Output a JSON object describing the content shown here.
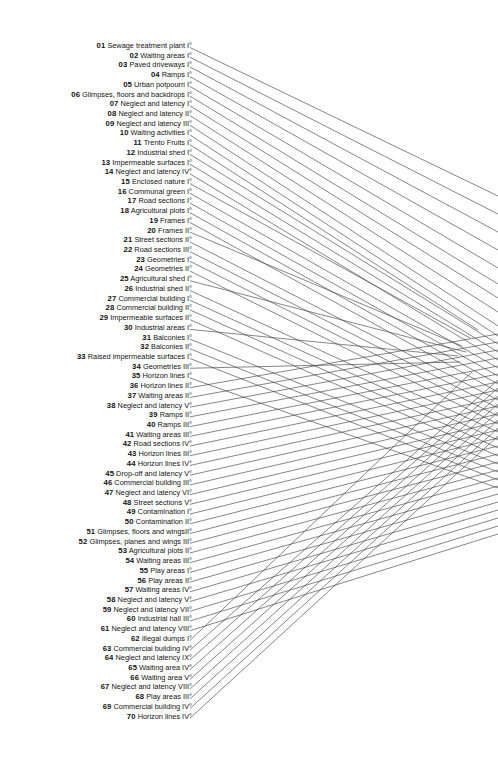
{
  "figure": {
    "type": "legend-with-leader-lines",
    "background_color": "#ffffff",
    "text_color": "#131313",
    "line_color": "#3a3a3a",
    "item_count": 70
  },
  "legend": {
    "items": [
      {
        "num": "01",
        "label": "Sewage treatment plant I°"
      },
      {
        "num": "02",
        "label": "Waiting areas I°"
      },
      {
        "num": "03",
        "label": "Paved driveways I°"
      },
      {
        "num": "04",
        "label": "Ramps I°"
      },
      {
        "num": "05",
        "label": "Urban potpourri I°"
      },
      {
        "num": "06",
        "label": "Glimpses, floors and backdrops I°"
      },
      {
        "num": "07",
        "label": "Neglect and latency I°"
      },
      {
        "num": "08",
        "label": "Neglect and latency II°"
      },
      {
        "num": "09",
        "label": "Neglect and latency III°"
      },
      {
        "num": "10",
        "label": "Waiting activities I°"
      },
      {
        "num": "11",
        "label": "Trento Fruits I°"
      },
      {
        "num": "12",
        "label": "Industrial shed I°"
      },
      {
        "num": "13",
        "label": "Impermeable surfaces I°"
      },
      {
        "num": "14",
        "label": "Neglect and latency IV°"
      },
      {
        "num": "15",
        "label": "Enclosed nature I°"
      },
      {
        "num": "16",
        "label": "Communal green I°"
      },
      {
        "num": "17",
        "label": "Road sections I°"
      },
      {
        "num": "18",
        "label": "Agricultural plots I°"
      },
      {
        "num": "19",
        "label": "Frames I°"
      },
      {
        "num": "20",
        "label": "Frames II°"
      },
      {
        "num": "21",
        "label": "Street sections II°"
      },
      {
        "num": "22",
        "label": "Road sections III°"
      },
      {
        "num": "23",
        "label": "Geometries I°"
      },
      {
        "num": "24",
        "label": "Geometries II°"
      },
      {
        "num": "25",
        "label": "Agricultural shed I°"
      },
      {
        "num": "26",
        "label": "Industrial shed II°"
      },
      {
        "num": "27",
        "label": "Commercial building I°"
      },
      {
        "num": "28",
        "label": "Commercial building II°"
      },
      {
        "num": "29",
        "label": "Impermeable surfaces II°"
      },
      {
        "num": "30",
        "label": "Industrial areas I°"
      },
      {
        "num": "31",
        "label": "Balconies I°"
      },
      {
        "num": "32",
        "label": "Balconies II°"
      },
      {
        "num": "33",
        "label": "Raised impermeable surfaces I°"
      },
      {
        "num": "34",
        "label": "Geometries III°"
      },
      {
        "num": "35",
        "label": "Horizon lines I°"
      },
      {
        "num": "36",
        "label": "Horizon lines II°"
      },
      {
        "num": "37",
        "label": "Waiting areas II°"
      },
      {
        "num": "38",
        "label": "Neglect and latency V°"
      },
      {
        "num": "39",
        "label": "Ramps II°"
      },
      {
        "num": "40",
        "label": "Ramps III°"
      },
      {
        "num": "41",
        "label": "Waiting areas III°"
      },
      {
        "num": "42",
        "label": "Road sections IV°"
      },
      {
        "num": "43",
        "label": "Horizon lines III°"
      },
      {
        "num": "44",
        "label": "Horizon lines IV°"
      },
      {
        "num": "45",
        "label": "Drop-off and latency V°"
      },
      {
        "num": "46",
        "label": "Commercial building III°"
      },
      {
        "num": "47",
        "label": "Neglect and latency VI°"
      },
      {
        "num": "48",
        "label": "Street sections V°"
      },
      {
        "num": "49",
        "label": "Contamination I°"
      },
      {
        "num": "50",
        "label": "Contamination II°"
      },
      {
        "num": "51",
        "label": "Glimpses, floors and wingsII°"
      },
      {
        "num": "52",
        "label": "Glimpses, planes and wings III°"
      },
      {
        "num": "53",
        "label": "Agricultural plots II°"
      },
      {
        "num": "54",
        "label": "Waiting areas III°"
      },
      {
        "num": "55",
        "label": "Play areas I°"
      },
      {
        "num": "56",
        "label": "Play areas II°"
      },
      {
        "num": "57",
        "label": "Waiting areas IV°"
      },
      {
        "num": "58",
        "label": "Neglect and latency V°"
      },
      {
        "num": "59",
        "label": "Neglect and latency VII°"
      },
      {
        "num": "60",
        "label": "Industrial hall III°"
      },
      {
        "num": "61",
        "label": "Neglect and latency VIII°"
      },
      {
        "num": "62",
        "label": "Illegal dumps I°"
      },
      {
        "num": "63",
        "label": "Commercial building IV°"
      },
      {
        "num": "64",
        "label": "Neglect and latency IX°"
      },
      {
        "num": "65",
        "label": "Waiting area IV°"
      },
      {
        "num": "66",
        "label": "Waiting area V°"
      },
      {
        "num": "67",
        "label": "Neglect and latency VIII°"
      },
      {
        "num": "68",
        "label": "Play areas III°"
      },
      {
        "num": "69",
        "label": "Commercial building IV°"
      },
      {
        "num": "70",
        "label": "Horizon lines IV°"
      }
    ]
  },
  "leader_lines": {
    "start_x": 190,
    "first_row_y": 47.5,
    "row_step": 9.72,
    "end_targets": [
      {
        "x": 498,
        "y": 196
      },
      {
        "x": 498,
        "y": 214
      },
      {
        "x": 498,
        "y": 232
      },
      {
        "x": 498,
        "y": 250
      },
      {
        "x": 498,
        "y": 268
      },
      {
        "x": 498,
        "y": 284
      },
      {
        "x": 498,
        "y": 298
      },
      {
        "x": 498,
        "y": 312
      },
      {
        "x": 498,
        "y": 326
      },
      {
        "x": 498,
        "y": 336
      },
      {
        "x": 478,
        "y": 330
      },
      {
        "x": 498,
        "y": 344
      },
      {
        "x": 498,
        "y": 352
      },
      {
        "x": 498,
        "y": 360
      },
      {
        "x": 470,
        "y": 338
      },
      {
        "x": 498,
        "y": 368
      },
      {
        "x": 498,
        "y": 376
      },
      {
        "x": 498,
        "y": 384
      },
      {
        "x": 498,
        "y": 392
      },
      {
        "x": 462,
        "y": 346
      },
      {
        "x": 498,
        "y": 400
      },
      {
        "x": 498,
        "y": 408
      },
      {
        "x": 498,
        "y": 416
      },
      {
        "x": 498,
        "y": 424
      },
      {
        "x": 466,
        "y": 352
      },
      {
        "x": 498,
        "y": 432
      },
      {
        "x": 498,
        "y": 440
      },
      {
        "x": 498,
        "y": 448
      },
      {
        "x": 498,
        "y": 456
      },
      {
        "x": 458,
        "y": 356
      },
      {
        "x": 498,
        "y": 464
      },
      {
        "x": 498,
        "y": 472
      },
      {
        "x": 498,
        "y": 480
      },
      {
        "x": 460,
        "y": 362
      },
      {
        "x": 498,
        "y": 488
      },
      {
        "x": 498,
        "y": 334
      },
      {
        "x": 498,
        "y": 342
      },
      {
        "x": 498,
        "y": 350
      },
      {
        "x": 498,
        "y": 358
      },
      {
        "x": 498,
        "y": 366
      },
      {
        "x": 498,
        "y": 374
      },
      {
        "x": 498,
        "y": 382
      },
      {
        "x": 498,
        "y": 390
      },
      {
        "x": 498,
        "y": 398
      },
      {
        "x": 498,
        "y": 406
      },
      {
        "x": 498,
        "y": 414
      },
      {
        "x": 498,
        "y": 422
      },
      {
        "x": 498,
        "y": 430
      },
      {
        "x": 498,
        "y": 438
      },
      {
        "x": 498,
        "y": 446
      },
      {
        "x": 498,
        "y": 454
      },
      {
        "x": 498,
        "y": 462
      },
      {
        "x": 498,
        "y": 470
      },
      {
        "x": 498,
        "y": 478
      },
      {
        "x": 498,
        "y": 486
      },
      {
        "x": 498,
        "y": 494
      },
      {
        "x": 498,
        "y": 502
      },
      {
        "x": 498,
        "y": 510
      },
      {
        "x": 498,
        "y": 518
      },
      {
        "x": 498,
        "y": 526
      },
      {
        "x": 498,
        "y": 534
      },
      {
        "x": 472,
        "y": 372
      },
      {
        "x": 498,
        "y": 380
      },
      {
        "x": 498,
        "y": 388
      },
      {
        "x": 498,
        "y": 396
      },
      {
        "x": 498,
        "y": 404
      },
      {
        "x": 498,
        "y": 412
      },
      {
        "x": 498,
        "y": 420
      },
      {
        "x": 498,
        "y": 428
      },
      {
        "x": 498,
        "y": 436
      }
    ]
  }
}
